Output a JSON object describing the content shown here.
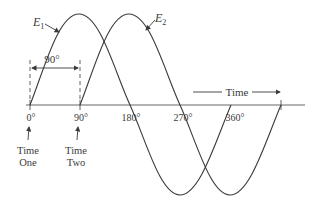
{
  "diagram": {
    "type": "phase-shift-sine-waves",
    "waves": [
      {
        "name": "E1",
        "label_base": "E",
        "label_sub": "1",
        "phase_deg": 0
      },
      {
        "name": "E2",
        "label_base": "E",
        "label_sub": "2",
        "phase_deg": 90
      }
    ],
    "phase_difference_label": "90°",
    "axis_ticks": [
      "0°",
      "90°",
      "180°",
      "270°",
      "360°"
    ],
    "time_label": "Time",
    "markers": [
      {
        "line1": "Time",
        "line2": "One",
        "at": "0°"
      },
      {
        "line1": "Time",
        "line2": "Two",
        "at": "90°"
      }
    ],
    "colors": {
      "line": "#3a3a3a",
      "background": "#ffffff"
    }
  }
}
